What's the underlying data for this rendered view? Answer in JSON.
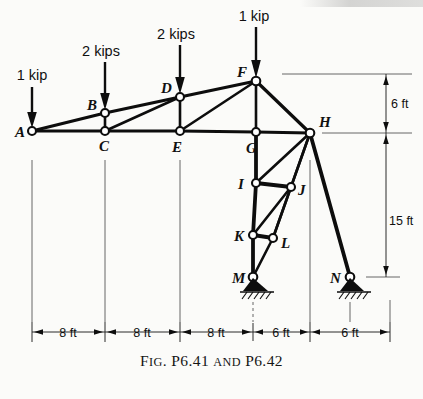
{
  "figure": {
    "caption_main_1": "F",
    "caption_small_1": "IG",
    "caption_main_2": ". P6.41 ",
    "caption_small_2": "AND",
    "caption_main_3": " P6.42",
    "caption_full": "FIG. P6.41 AND P6.42",
    "type": "truss-free-body-diagram"
  },
  "loads": [
    {
      "id": "load-a",
      "label": "1 kip",
      "at_joint": "A",
      "magnitude": 1,
      "unit": "kip",
      "direction": "down"
    },
    {
      "id": "load-b",
      "label": "2 kips",
      "at_joint": "B",
      "magnitude": 2,
      "unit": "kips",
      "direction": "down"
    },
    {
      "id": "load-d",
      "label": "2 kips",
      "at_joint": "D",
      "magnitude": 2,
      "unit": "kips",
      "direction": "down"
    },
    {
      "id": "load-f",
      "label": "1 kip",
      "at_joint": "F",
      "magnitude": 1,
      "unit": "kip",
      "direction": "down"
    }
  ],
  "joints": [
    {
      "label": "A",
      "x": 32,
      "y": 131
    },
    {
      "label": "B",
      "x": 105,
      "y": 113
    },
    {
      "label": "C",
      "x": 105,
      "y": 131
    },
    {
      "label": "D",
      "x": 180,
      "y": 97
    },
    {
      "label": "E",
      "x": 180,
      "y": 131
    },
    {
      "label": "F",
      "x": 256,
      "y": 81
    },
    {
      "label": "G",
      "x": 256,
      "y": 132
    },
    {
      "label": "H",
      "x": 310,
      "y": 133
    },
    {
      "label": "I",
      "x": 256,
      "y": 183
    },
    {
      "label": "J",
      "x": 291,
      "y": 187
    },
    {
      "label": "K",
      "x": 253,
      "y": 235
    },
    {
      "label": "L",
      "x": 273,
      "y": 238
    },
    {
      "label": "M",
      "x": 253,
      "y": 277
    },
    {
      "label": "N",
      "x": 350,
      "y": 277
    }
  ],
  "members": [
    [
      "A",
      "B"
    ],
    [
      "A",
      "C"
    ],
    [
      "B",
      "C"
    ],
    [
      "B",
      "D"
    ],
    [
      "C",
      "D"
    ],
    [
      "C",
      "E"
    ],
    [
      "D",
      "E"
    ],
    [
      "D",
      "F"
    ],
    [
      "E",
      "F"
    ],
    [
      "E",
      "G"
    ],
    [
      "F",
      "G"
    ],
    [
      "F",
      "H"
    ],
    [
      "G",
      "H"
    ],
    [
      "G",
      "I"
    ],
    [
      "H",
      "I"
    ],
    [
      "H",
      "J"
    ],
    [
      "H",
      "L"
    ],
    [
      "H",
      "N"
    ],
    [
      "I",
      "J"
    ],
    [
      "I",
      "K"
    ],
    [
      "J",
      "K"
    ],
    [
      "J",
      "L"
    ],
    [
      "K",
      "L"
    ],
    [
      "K",
      "M"
    ],
    [
      "L",
      "M"
    ]
  ],
  "supports": [
    {
      "at_joint": "M",
      "type": "pin"
    },
    {
      "at_joint": "N",
      "type": "pin"
    }
  ],
  "dimensions": {
    "horizontal": [
      {
        "label": "8 ft",
        "value": 8,
        "unit": "ft",
        "from": "A",
        "to": "C"
      },
      {
        "label": "8 ft",
        "value": 8,
        "unit": "ft",
        "from": "C",
        "to": "E"
      },
      {
        "label": "8 ft",
        "value": 8,
        "unit": "ft",
        "from": "E",
        "to": "G"
      },
      {
        "label": "6 ft",
        "value": 6,
        "unit": "ft",
        "from": "G",
        "to": "H"
      },
      {
        "label": "6 ft",
        "value": 6,
        "unit": "ft",
        "from": "H",
        "to": "N"
      }
    ],
    "vertical": [
      {
        "label": "6 ft",
        "value": 6,
        "unit": "ft",
        "from": "F",
        "to": "H"
      },
      {
        "label": "15 ft",
        "value": 15,
        "unit": "ft",
        "from": "H",
        "to": "N"
      }
    ]
  },
  "colors": {
    "ink": "#0d0d0d",
    "paper": "#fbfbf9",
    "dimension": "#2b2b2b"
  }
}
